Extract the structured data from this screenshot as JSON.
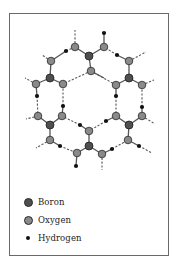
{
  "diagram": {
    "colors": {
      "boron": "#4f4f4f",
      "oxygen": "#8a8a8a",
      "hydrogen": "#111111",
      "bond": "#555555",
      "frame": "#6a6a6a"
    },
    "atoms": {
      "boron": [
        [
          89,
          56
        ],
        [
          50,
          78
        ],
        [
          129,
          78
        ],
        [
          50,
          125
        ],
        [
          129,
          125
        ],
        [
          89,
          146
        ]
      ],
      "oxygen": [
        [
          75,
          47
        ],
        [
          104,
          47
        ],
        [
          91,
          71
        ],
        [
          51,
          61
        ],
        [
          129,
          61
        ],
        [
          36,
          84
        ],
        [
          63,
          84
        ],
        [
          116,
          85
        ],
        [
          142,
          85
        ],
        [
          38,
          116
        ],
        [
          62,
          116
        ],
        [
          116,
          116
        ],
        [
          142,
          116
        ],
        [
          50,
          140
        ],
        [
          128,
          140
        ],
        [
          89,
          131
        ],
        [
          77,
          153
        ],
        [
          102,
          154
        ]
      ],
      "hydrogen": [
        [
          104,
          33
        ],
        [
          66,
          51
        ],
        [
          117,
          55
        ],
        [
          37,
          96
        ],
        [
          63,
          106
        ],
        [
          116,
          96
        ],
        [
          142,
          107
        ],
        [
          80,
          125
        ],
        [
          106,
          121
        ],
        [
          60,
          146
        ],
        [
          139,
          146
        ],
        [
          76,
          166
        ],
        [
          112,
          149
        ]
      ]
    }
  },
  "legend": {
    "items": [
      {
        "label": "Boron",
        "symbol": "boron"
      },
      {
        "label": "Oxygen",
        "symbol": "oxygen"
      },
      {
        "label": "Hydrogen",
        "symbol": "hydrogen"
      }
    ]
  }
}
